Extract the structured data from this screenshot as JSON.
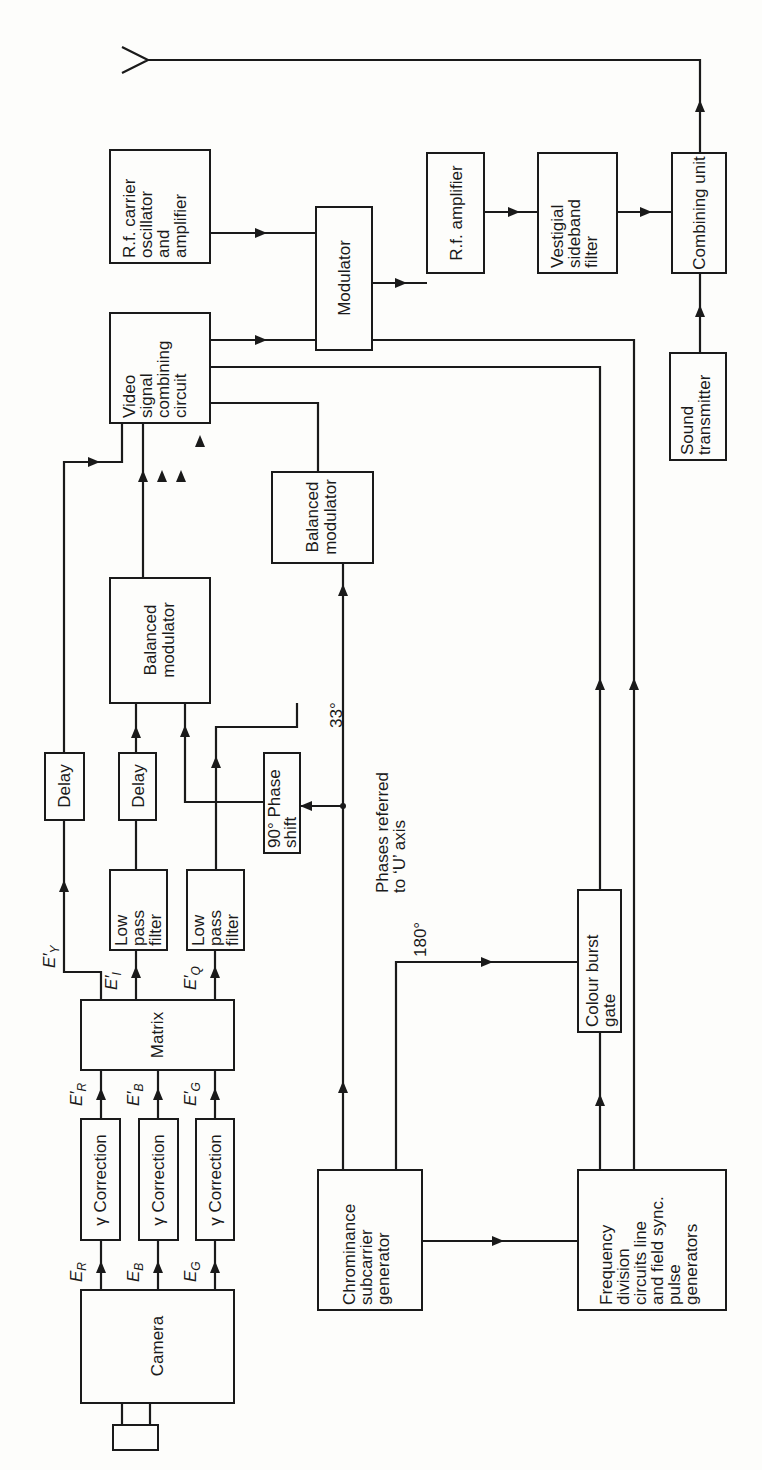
{
  "diagram": {
    "orientation": "rotated-90-ccw",
    "blocks": {
      "camera": {
        "label": [
          "Camera"
        ]
      },
      "gamma_r": {
        "label": [
          "γ Correction"
        ]
      },
      "gamma_b": {
        "label": [
          "γ Correction"
        ]
      },
      "gamma_g": {
        "label": [
          "γ Correction"
        ]
      },
      "matrix": {
        "label": [
          "Matrix"
        ]
      },
      "lpf_i": {
        "label": [
          "Low",
          "pass",
          "filter"
        ]
      },
      "lpf_q": {
        "label": [
          "Low",
          "pass",
          "filter"
        ]
      },
      "delay_y": {
        "label": [
          "Delay"
        ]
      },
      "delay_i": {
        "label": [
          "Delay"
        ]
      },
      "bal_mod_1": {
        "label": [
          "Balanced",
          "modulator"
        ]
      },
      "bal_mod_2": {
        "label": [
          "Balanced",
          "modulator"
        ]
      },
      "phase_shift": {
        "label": [
          "90° Phase",
          "shift"
        ]
      },
      "video_combining": {
        "label": [
          "Video",
          "signal",
          "combining",
          "circuit"
        ]
      },
      "rf_carrier": {
        "label": [
          "R.f. carrier",
          "oscillator",
          "and",
          "amplifier"
        ]
      },
      "modulator": {
        "label": [
          "Modulator"
        ]
      },
      "rf_amplifier": {
        "label": [
          "R.f. amplifier"
        ]
      },
      "vsb_filter": {
        "label": [
          "Vestigial",
          "sideband",
          "filter"
        ]
      },
      "combining_unit": {
        "label": [
          "Combining unit"
        ]
      },
      "sound_transmitter": {
        "label": [
          "Sound",
          "transmitter"
        ]
      },
      "chroma_gen": {
        "label": [
          "Chrominance",
          "subcarrier",
          "generator"
        ]
      },
      "freq_div": {
        "label": [
          "Frequency",
          "division",
          "circuits line",
          "and field sync.",
          "pulse",
          "generators"
        ]
      },
      "burst_gate": {
        "label": [
          "Colour burst",
          "gate"
        ]
      }
    },
    "signals": {
      "er": {
        "main": "E",
        "sub": "R"
      },
      "eb": {
        "main": "E",
        "sub": "B"
      },
      "eg": {
        "main": "E",
        "sub": "G"
      },
      "epr": {
        "main": "E′",
        "sub": "R"
      },
      "epb": {
        "main": "E′",
        "sub": "B"
      },
      "epg": {
        "main": "E′",
        "sub": "G"
      },
      "epy": {
        "main": "E′",
        "sub": "Y"
      },
      "epi": {
        "main": "E′",
        "sub": "I"
      },
      "epq": {
        "main": "E′",
        "sub": "Q"
      }
    },
    "annotations": {
      "phase_33": "33°",
      "phase_180": "180°",
      "phases_note": [
        "Phases referred",
        "to ‘U’ axis"
      ]
    }
  }
}
